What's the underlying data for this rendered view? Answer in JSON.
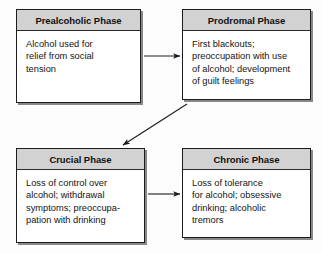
{
  "diagram": {
    "type": "flowchart",
    "background_color": "#fdfdfd",
    "header_fill": "#d2d2d2",
    "border_color": "#1c1c1c",
    "nodes": [
      {
        "id": "prealcoholic",
        "title": "Prealcoholic Phase",
        "body_lines": [
          "Alcohol used for",
          "relief from social",
          "tension"
        ],
        "body_text": "Alcohol used for relief from social tension"
      },
      {
        "id": "prodromal",
        "title": "Prodromal Phase",
        "body_lines": [
          "First blackouts;",
          "preoccupation with use",
          "of alcohol; development",
          "of guilt feelings"
        ],
        "body_text": "First blackouts; preoccupation with use of alcohol; development of guilt feelings"
      },
      {
        "id": "crucial",
        "title": "Crucial Phase",
        "body_lines": [
          "Loss of control over",
          "alcohol; withdrawal",
          "symptoms; preoccupa-",
          "pation with drinking"
        ],
        "body_text": "Loss of control over alcohol; withdrawal symptoms; preoccupation with drinking"
      },
      {
        "id": "chronic",
        "title": "Chronic Phase",
        "body_lines": [
          "Loss of tolerance",
          "for alcohol; obsessive",
          "drinking; alcoholic",
          "tremors"
        ],
        "body_text": "Loss of tolerance for alcohol; obsessive drinking; alcoholic tremors"
      }
    ],
    "connectors": [
      {
        "id": "prealcoholic-to-prodromal",
        "from": "prealcoholic",
        "to": "prodromal",
        "style": "straight-horizontal"
      },
      {
        "id": "prodromal-to-crucial",
        "from": "prodromal",
        "to": "crucial",
        "style": "diagonal"
      },
      {
        "id": "crucial-to-chronic",
        "from": "crucial",
        "to": "chronic",
        "style": "straight-horizontal"
      }
    ]
  }
}
